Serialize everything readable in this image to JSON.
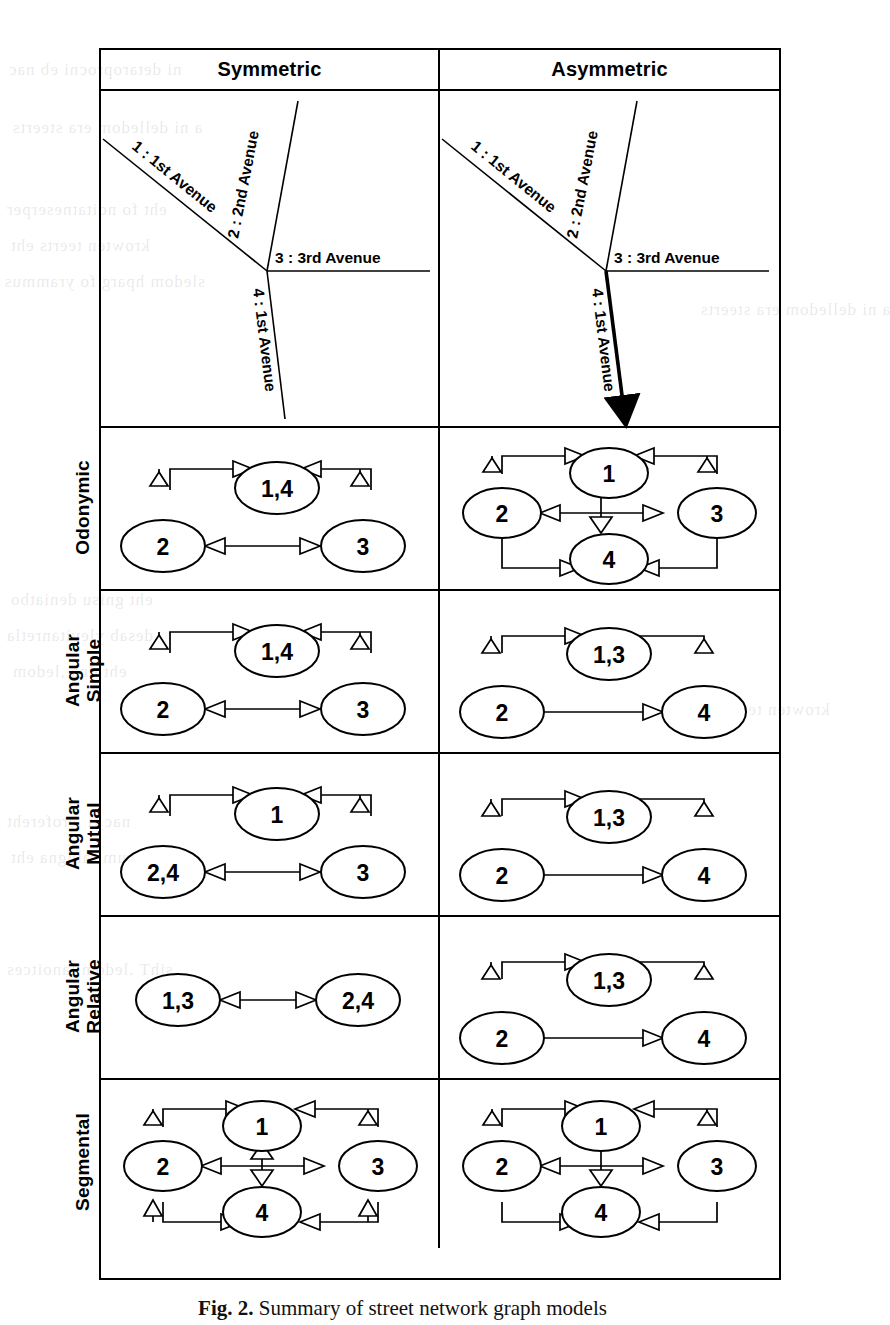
{
  "figure": {
    "caption_label": "Fig. 2.",
    "caption_text": "Summary of street network graph models",
    "columns": [
      "Symmetric",
      "Asymmetric"
    ],
    "row_labels": [
      "Odonymic",
      "Angular Simple",
      "Angular Mutual",
      "Angular Relative",
      "Segmental"
    ]
  },
  "maps": {
    "symmetric": {
      "title": "Symmetric",
      "streets": [
        {
          "id": "1",
          "label": "1 : 1st Avenue",
          "oneway": false
        },
        {
          "id": "2",
          "label": "2 : 2nd Avenue",
          "oneway": false
        },
        {
          "id": "3",
          "label": "3 : 3rd Avenue",
          "oneway": false
        },
        {
          "id": "4",
          "label": "4 : 1st Avenue",
          "oneway": false
        }
      ]
    },
    "asymmetric": {
      "title": "Asymmetric",
      "streets": [
        {
          "id": "1",
          "label": "1 : 1st Avenue",
          "oneway": false
        },
        {
          "id": "2",
          "label": "2 : 2nd Avenue",
          "oneway": false
        },
        {
          "id": "3",
          "label": "3 : 3rd Avenue",
          "oneway": false
        },
        {
          "id": "4",
          "label": "4 : 1st Avenue",
          "oneway": true
        }
      ]
    }
  },
  "graphs": {
    "odonymic_symmetric": {
      "nodes": [
        "1,4",
        "2",
        "3"
      ],
      "edges": [
        "2->1,4",
        "1,4->2",
        "3->1,4",
        "1,4->3",
        "3->2",
        "2->3"
      ]
    },
    "odonymic_asymmetric": {
      "nodes": [
        "1",
        "2",
        "3",
        "4"
      ],
      "edges": [
        "2->1",
        "1->2",
        "3->1",
        "1->3",
        "3->2",
        "2->3",
        "1->4",
        "2->4",
        "3->4"
      ]
    },
    "angular_simple_symmetric": {
      "nodes": [
        "1,4",
        "2",
        "3"
      ],
      "edges": [
        "2->1,4",
        "1,4->2",
        "3->1,4",
        "1,4->3",
        "3->2",
        "2->3"
      ]
    },
    "angular_simple_asymmetric": {
      "nodes": [
        "1,3",
        "2",
        "4"
      ],
      "edges": [
        "2->1,3",
        "1,3->2",
        "1,3->4",
        "2->4"
      ]
    },
    "angular_mutual_symmetric": {
      "nodes": [
        "1",
        "2,4",
        "3"
      ],
      "edges": [
        "2,4->1",
        "1->2,4",
        "3->1",
        "1->3",
        "3->2,4",
        "2,4->3"
      ]
    },
    "angular_mutual_asymmetric": {
      "nodes": [
        "1,3",
        "2",
        "4"
      ],
      "edges": [
        "2->1,3",
        "1,3->2",
        "1,3->4",
        "2->4"
      ]
    },
    "angular_relative_symmetric": {
      "nodes": [
        "1,3",
        "2,4"
      ],
      "edges": [
        "2,4->1,3",
        "1,3->2,4"
      ]
    },
    "angular_relative_asymmetric": {
      "nodes": [
        "1,3",
        "2",
        "4"
      ],
      "edges": [
        "2->1,3",
        "1,3->2",
        "1,3->4",
        "2->4"
      ]
    },
    "segmental_symmetric": {
      "nodes": [
        "1",
        "2",
        "3",
        "4"
      ],
      "edges": [
        "2->1",
        "1->2",
        "3->1",
        "1->3",
        "3->2",
        "2->3",
        "1->4",
        "4->1",
        "2->4",
        "4->2",
        "3->4",
        "4->3"
      ]
    },
    "segmental_asymmetric": {
      "nodes": [
        "1",
        "2",
        "3",
        "4"
      ],
      "edges": [
        "2->1",
        "1->2",
        "3->1",
        "1->3",
        "3->2",
        "2->3",
        "1->4",
        "2->4",
        "3->4"
      ]
    }
  },
  "bleed_text": [
    "ni detaroprocni eb nac",
    "a ni delledom era steerts",
    "eht fo noitatneserper",
    "krowten teerts eht",
    "sledom hparg fo yrammus",
    "eht gnisu deniatbo",
    "desab ylevitanretla",
    "eht dna ,ledom",
    "nac ti ,erofereht",
    "lautum ralugna eht",
    "sihT .ledom lanoitces"
  ]
}
